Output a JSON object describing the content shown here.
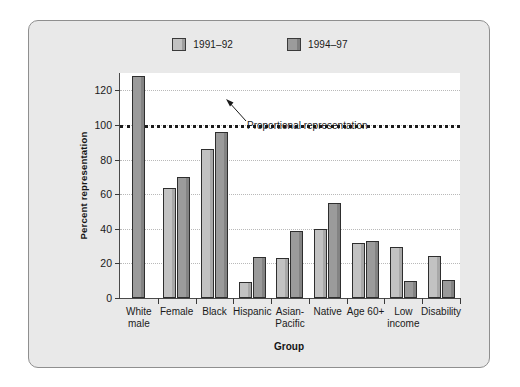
{
  "chart_data": {
    "type": "bar",
    "title": "",
    "xlabel": "Group",
    "ylabel": "Percent representation",
    "ylim": [
      0,
      130
    ],
    "yticks": [
      0,
      20,
      40,
      60,
      80,
      100,
      120
    ],
    "grid": true,
    "legend_position": "top-center",
    "categories": [
      "White\nmale",
      "Female",
      "Black",
      "Hispanic",
      "Asian-\nPacific",
      "Native",
      "Age 60+",
      "Low\nincome",
      "Disability"
    ],
    "series": [
      {
        "name": "1991–92",
        "color": "#c2c2c2",
        "values": [
          null,
          63.5,
          86,
          9,
          23,
          40,
          32,
          29.5,
          24
        ]
      },
      {
        "name": "1994–97",
        "color": "#9b9b9b",
        "values": [
          128,
          70,
          96,
          23.5,
          38.5,
          55,
          33,
          10,
          10.5
        ]
      }
    ],
    "reference_line": {
      "value": 100,
      "label": "Proportional representation",
      "style": "dotted"
    }
  },
  "legend": {
    "items": [
      {
        "label": "1991–92",
        "swatch": "legend-swatch-1991-92"
      },
      {
        "label": "1994–97",
        "swatch": "legend-swatch-1994-97"
      }
    ]
  },
  "colors": {
    "panel_background": "#e9e9e9",
    "plot_background": "#ffffff",
    "frame_border": "#8f8f8f",
    "axis": "#4a4a4a",
    "gridline": "#b9b9b9",
    "reference_line": "#1b1b1b",
    "series_1991_92": "#c2c2c2",
    "series_1994_97": "#9b9b9b",
    "text": "#1a1a1a"
  }
}
